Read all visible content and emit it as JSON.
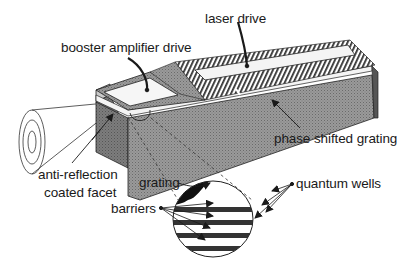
{
  "diagram": {
    "type": "device-schematic",
    "labels": {
      "laser_drive": "laser drive",
      "booster_amplifier_drive": "booster amplifier drive",
      "phase_shifted_grating": "phase shifted grating",
      "anti_reflection_line1": "anti-reflection",
      "anti_reflection_line2": "coated facet",
      "grating": "grating",
      "quantum_wells": "quantum wells",
      "barriers": "barriers"
    },
    "colors": {
      "background": "#ffffff",
      "ink": "#1a1a1a",
      "body_fill": "#8a8a8a",
      "body_dark": "#6e6e6e",
      "contact_fill": "#f2f2f2"
    }
  }
}
